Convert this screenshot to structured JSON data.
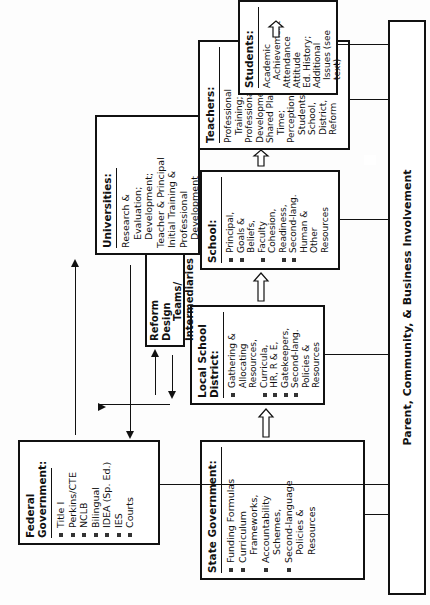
{
  "diagram": {
    "orientation": "rotated-90-ccw",
    "federal": {
      "title": "Federal Government:",
      "items": [
        "Title I",
        "Perkins/CTE",
        "NCLB",
        "Bilingual",
        "IDEA (Sp. Ed.)",
        "IES",
        "Courts"
      ]
    },
    "state": {
      "title": "State Government:",
      "items": [
        {
          "text": "Funding Formulas",
          "bullet": true
        },
        {
          "text": "Curriculum",
          "bullet": true
        },
        {
          "text": "Frameworks,",
          "bullet": false
        },
        {
          "text": "Accountability",
          "bullet": true
        },
        {
          "text": "Schemes,",
          "bullet": false
        },
        {
          "text": "Second-language",
          "bullet": true
        },
        {
          "text": "Policies &",
          "bullet": false
        },
        {
          "text": "Resources",
          "bullet": false
        }
      ]
    },
    "district": {
      "title_line1": "Local School",
      "title_line2": "District:",
      "items": [
        {
          "text": "Gathering &",
          "bullet": true
        },
        {
          "text": "Allocating",
          "bullet": false
        },
        {
          "text": "Resources,",
          "bullet": false
        },
        {
          "text": "Curricula,",
          "bullet": true
        },
        {
          "text": "HR, R & E,",
          "bullet": true
        },
        {
          "text": "Gatekeepers,",
          "bullet": true
        },
        {
          "text": "Second-lang.",
          "bullet": true
        },
        {
          "text": "Policies &",
          "bullet": false
        },
        {
          "text": "Resources",
          "bullet": false
        }
      ]
    },
    "reform": {
      "title_line1": "Reform Design",
      "title_line2": "Teams/",
      "title_line3": "Intermediaries"
    },
    "universities": {
      "title": "Universities:",
      "lines": [
        {
          "text": "Research &",
          "indent": false
        },
        {
          "text": "Evaluation;",
          "indent": true
        },
        {
          "text": "Development;",
          "indent": true
        },
        {
          "text": "Teacher & Principal",
          "indent": false
        },
        {
          "text": "Initial Training &",
          "indent": false
        },
        {
          "text": "Professional",
          "indent": false
        },
        {
          "text": "Development",
          "indent": true
        }
      ]
    },
    "school": {
      "title": "School:",
      "items": [
        {
          "text": "Principal,",
          "bullet": true
        },
        {
          "text": "Goals &",
          "bullet": true
        },
        {
          "text": "Beliefs,",
          "bullet": false
        },
        {
          "text": "Faculty",
          "bullet": true
        },
        {
          "text": "Cohesion,",
          "bullet": false
        },
        {
          "text": "Readiness,",
          "bullet": true
        },
        {
          "text": "Second-lang.",
          "bullet": true
        },
        {
          "text": "Human &",
          "bullet": false
        },
        {
          "text": "Other",
          "bullet": false
        },
        {
          "text": "Resources",
          "bullet": false
        }
      ]
    },
    "teachers": {
      "title": "Teachers:",
      "lines": [
        {
          "text": "Professional",
          "indent": false
        },
        {
          "text": "Training;",
          "indent": true
        },
        {
          "text": "Professional",
          "indent": false
        },
        {
          "text": "Development;",
          "indent": false
        },
        {
          "text": "Shared Plan.-",
          "indent": false
        },
        {
          "text": "Time;",
          "indent": true
        },
        {
          "text": "Perceptions of:",
          "indent": false
        },
        {
          "text": "Students,",
          "indent": true
        },
        {
          "text": "School,",
          "indent": true
        },
        {
          "text": "District,",
          "indent": true
        },
        {
          "text": "Reform",
          "indent": true
        }
      ]
    },
    "students": {
      "title": "Students:",
      "lines": [
        {
          "text": "Academic",
          "indent": false
        },
        {
          "text": "Achievement",
          "indent": true
        },
        {
          "text": "Attendance",
          "indent": false
        },
        {
          "text": "Attitude",
          "indent": false
        },
        {
          "text": "Ed. History;",
          "indent": false
        },
        {
          "text": "Additional",
          "indent": false
        },
        {
          "text": "Issues (see",
          "indent": true
        },
        {
          "text": "text)",
          "indent": true
        }
      ]
    },
    "parent_bar": {
      "label": "Parent, Community, & Business Involvement"
    }
  }
}
